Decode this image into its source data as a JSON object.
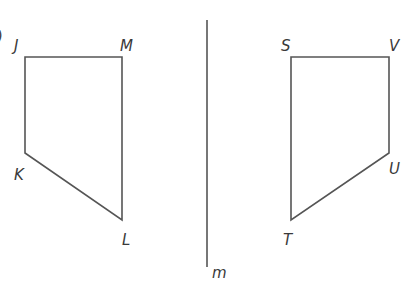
{
  "diagram": {
    "type": "reflection across a line",
    "colors": {
      "stroke": "#555555",
      "text": "#3a3a3a"
    },
    "line_of_reflection": {
      "label": "m",
      "x": 207,
      "y1": 20,
      "y2": 267
    },
    "left_figure": {
      "name": "JMLK",
      "vertices": {
        "J": {
          "label": "J",
          "x": 25,
          "y": 57
        },
        "M": {
          "label": "M",
          "x": 122,
          "y": 57
        },
        "L": {
          "label": "L",
          "x": 122,
          "y": 220
        },
        "K": {
          "label": "K",
          "x": 25,
          "y": 153
        }
      }
    },
    "right_figure": {
      "name": "SVUT",
      "vertices": {
        "S": {
          "label": "S",
          "x": 291,
          "y": 57
        },
        "V": {
          "label": "V",
          "x": 389,
          "y": 57
        },
        "U": {
          "label": "U",
          "x": 389,
          "y": 153
        },
        "T": {
          "label": "T",
          "x": 291,
          "y": 220
        }
      }
    },
    "partial_label": ")"
  }
}
